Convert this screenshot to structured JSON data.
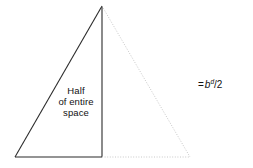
{
  "figure": {
    "name": "half-of-entire-space-triangle",
    "background_color": "#ffffff",
    "solid_stroke_color": "#2b2b2b",
    "dotted_stroke_color": "#c8c8c8",
    "inner_label": {
      "line1": "Half",
      "line2": "of entire",
      "line3": "space"
    },
    "formula": {
      "equals": "=",
      "base": "b",
      "exponent": "d",
      "divisor": "/2",
      "full_text": "= bᵈ/2"
    },
    "geometry": {
      "apex": [
        102,
        6
      ],
      "bottom_left": [
        15,
        157
      ],
      "bottom_right": [
        190,
        157
      ],
      "midpoint_base": [
        102,
        157
      ]
    }
  }
}
